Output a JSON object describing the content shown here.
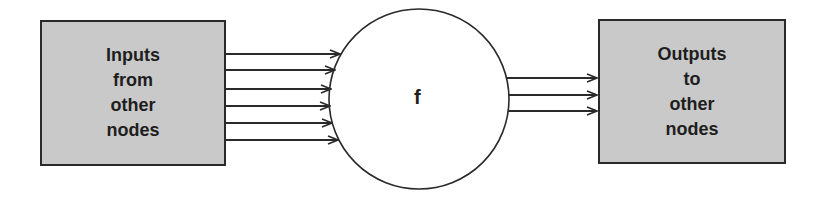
{
  "diagram": {
    "input_box": {
      "lines": [
        "Inputs",
        "from",
        "other",
        "nodes"
      ],
      "fill": "#c9c9c9"
    },
    "node": {
      "label": "f",
      "cx": 419,
      "cy": 99,
      "r": 90
    },
    "output_box": {
      "lines": [
        "Outputs",
        "to",
        "other",
        "nodes"
      ],
      "fill": "#c9c9c9"
    },
    "input_arrows": {
      "count": 6,
      "y": [
        54,
        70,
        89,
        106,
        123,
        140
      ]
    },
    "output_arrows": {
      "count": 3,
      "y": [
        78,
        95,
        111
      ]
    },
    "stroke_color": "#2a2a2a"
  }
}
